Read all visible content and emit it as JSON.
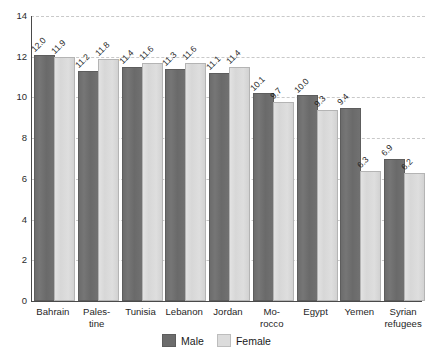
{
  "chart_data": {
    "type": "bar",
    "title": "",
    "subtitle": "",
    "xlabel": "",
    "ylabel": "",
    "ylim": [
      0,
      14
    ],
    "yticks": [
      0,
      2,
      4,
      6,
      8,
      10,
      12,
      14
    ],
    "ytick_labels": [
      "0",
      "2",
      "4",
      "6",
      "8",
      "10",
      "12",
      "14"
    ],
    "grid": true,
    "grid_style": "dashed horizontal",
    "legend_position": "bottom-center",
    "categories": [
      "Bahrain",
      "Palestine",
      "Tunisia",
      "Lebanon",
      "Jordan",
      "Morocco",
      "Egypt",
      "Yemen",
      "Syrian refugees"
    ],
    "category_lines": [
      [
        "Bahrain"
      ],
      [
        "Pales-",
        "tine"
      ],
      [
        "Tunisia"
      ],
      [
        "Lebanon"
      ],
      [
        "Jordan"
      ],
      [
        "Mo-",
        "rocco"
      ],
      [
        "Egypt"
      ],
      [
        "Yemen"
      ],
      [
        "Syrian",
        "refugees"
      ]
    ],
    "series": [
      {
        "name": "Male",
        "color": "#6c6c6c",
        "values": [
          12.0,
          11.2,
          11.4,
          11.3,
          11.1,
          10.1,
          10.0,
          9.4,
          6.9
        ],
        "value_labels": [
          "12.0",
          "11.2",
          "11.4",
          "11.3",
          "11.1",
          "10.1",
          "10.0",
          "9.4",
          "6.9"
        ]
      },
      {
        "name": "Female",
        "color": "#dcdcdc",
        "values": [
          11.9,
          11.8,
          11.6,
          11.6,
          11.4,
          9.7,
          9.3,
          6.3,
          6.2
        ],
        "value_labels": [
          "11.9",
          "11.8",
          "11.6",
          "11.6",
          "11.4",
          "9.7",
          "9.3",
          "6.3",
          "6.2"
        ]
      }
    ]
  },
  "legend": {
    "items": [
      {
        "label": "Male",
        "color": "#6c6c6c"
      },
      {
        "label": "Female",
        "color": "#dcdcdc"
      }
    ]
  }
}
